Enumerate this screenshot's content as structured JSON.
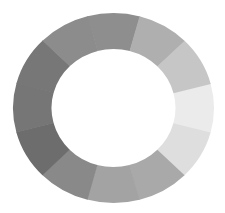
{
  "diagram": {
    "type": "segmented-ring",
    "center": {
      "x": 113.5,
      "y": 108
    },
    "outer_radius": {
      "rx": 100.5,
      "ry": 95
    },
    "inner_radius": {
      "rx": 62,
      "ry": 59
    },
    "segment_count": 12,
    "start_angle_deg": -15,
    "segments": [
      {
        "angle_center": 0,
        "color": "#ebebeb"
      },
      {
        "angle_center": 30,
        "color": "#dedede"
      },
      {
        "angle_center": 60,
        "color": "#a9a9a9"
      },
      {
        "angle_center": 90,
        "color": "#a3a3a3"
      },
      {
        "angle_center": 120,
        "color": "#898989"
      },
      {
        "angle_center": 150,
        "color": "#6d6d6d"
      },
      {
        "angle_center": 180,
        "color": "#767676"
      },
      {
        "angle_center": 210,
        "color": "#777777"
      },
      {
        "angle_center": 240,
        "color": "#8c8c8c"
      },
      {
        "angle_center": 270,
        "color": "#8e8e8e"
      },
      {
        "angle_center": 300,
        "color": "#afafaf"
      },
      {
        "angle_center": 330,
        "color": "#c6c6c6"
      }
    ],
    "background": "#ffffff"
  }
}
